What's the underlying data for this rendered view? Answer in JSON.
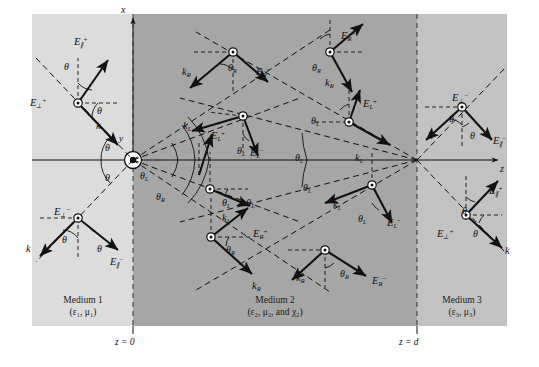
{
  "figure": {
    "type": "physics-ray-diagram",
    "axes": {
      "x_label": "x",
      "z_label": "z",
      "y_label": "y"
    },
    "boundaries": [
      {
        "name": "z=0",
        "label": "z = 0",
        "x": 133
      },
      {
        "name": "z=d",
        "label": "z = d",
        "x": 417
      }
    ],
    "media": [
      {
        "id": "medium1",
        "name": "Medium 1",
        "params": "(ε₁, μ₁)",
        "shade": "#dcdcdc"
      },
      {
        "id": "medium2",
        "name": "Medium 2",
        "params": "(ε₂, μ₂, and χ₂)",
        "shade": "#a8a8a8"
      },
      {
        "id": "medium3",
        "name": "Medium 3",
        "params": "(ε₃, μ₃)",
        "shade": "#c4c4c4"
      }
    ],
    "angle_labels": [
      {
        "name": "theta-m1-inc-upper",
        "text": "θ",
        "x": 64,
        "y": 61
      },
      {
        "name": "theta-m1-inc-lower",
        "text": "θ",
        "x": 97,
        "y": 105
      },
      {
        "name": "theta-origin-upper",
        "text": "θ",
        "x": 105,
        "y": 142
      },
      {
        "name": "theta-origin-lower",
        "text": "θ",
        "x": 105,
        "y": 172
      },
      {
        "name": "theta-m1-ref-upper",
        "text": "θ",
        "x": 62,
        "y": 234
      },
      {
        "name": "theta-m1-ref-lower",
        "text": "θ",
        "x": 97,
        "y": 243
      },
      {
        "name": "thetaL-origin",
        "text": "θ",
        "sub": "L",
        "x": 140,
        "y": 170
      },
      {
        "name": "thetaR-origin",
        "text": "θ",
        "sub": "R",
        "x": 156,
        "y": 191
      },
      {
        "name": "thetaR-m2-topleft",
        "text": "θ",
        "sub": "R",
        "x": 228,
        "y": 62
      },
      {
        "name": "thetaL-m2-upper",
        "text": "θ",
        "sub": "L",
        "x": 237,
        "y": 145
      },
      {
        "name": "thetaL-m2-lower-left",
        "text": "θ",
        "sub": "L",
        "x": 222,
        "y": 197
      },
      {
        "name": "thetaR-m2-lowerleft",
        "text": "θ",
        "sub": "R",
        "x": 226,
        "y": 244
      },
      {
        "name": "thetaR-m2-topright",
        "text": "θ",
        "sub": "R",
        "x": 312,
        "y": 62
      },
      {
        "name": "thetaL-m2-topright",
        "text": "θ",
        "sub": "L",
        "x": 311,
        "y": 115
      },
      {
        "name": "thetaL-m2-bigarc",
        "text": "θ",
        "sub": "L",
        "x": 295,
        "y": 152
      },
      {
        "name": "thetaL-m2-mid",
        "text": "θ",
        "sub": "L",
        "x": 303,
        "y": 182
      },
      {
        "name": "thetaL-m2-node",
        "text": "θ",
        "sub": "L",
        "x": 358,
        "y": 213
      },
      {
        "name": "thetaR-m2-bottom",
        "text": "θ",
        "sub": "R",
        "x": 340,
        "y": 268
      },
      {
        "name": "theta-m3-upper-a",
        "text": "θ",
        "x": 449,
        "y": 113
      },
      {
        "name": "theta-m3-upper-b",
        "text": "θ",
        "x": 470,
        "y": 130
      },
      {
        "name": "theta-m3-lower-a",
        "text": "θ",
        "x": 462,
        "y": 205
      },
      {
        "name": "theta-m3-lower-b",
        "text": "θ",
        "x": 473,
        "y": 228
      }
    ],
    "field_labels": [
      {
        "name": "E-par-plus-m1",
        "base": "E",
        "sub": "∥",
        "sup": "+",
        "x": 74,
        "y": 36
      },
      {
        "name": "E-perp-plus-m1",
        "base": "E",
        "sub": "⊥",
        "sup": "+",
        "x": 30,
        "y": 97
      },
      {
        "name": "k-inc-m1",
        "base": "k",
        "sub": "",
        "sup": "",
        "x": 96,
        "y": 120
      },
      {
        "name": "E-perp-minus-m1",
        "base": "E",
        "sub": "⊥",
        "sup": "−",
        "x": 54,
        "y": 206
      },
      {
        "name": "k-ref-m1",
        "base": "k",
        "sub": "",
        "sup": "",
        "x": 26,
        "y": 243
      },
      {
        "name": "E-par-minus-m1",
        "base": "E",
        "sub": "∥",
        "sup": "−",
        "x": 110,
        "y": 256
      },
      {
        "name": "kR-m2-topleft",
        "base": "k",
        "sub": "R",
        "sup": "",
        "x": 182,
        "y": 66
      },
      {
        "name": "ER-minus-m2-topleft",
        "base": "E",
        "sub": "R",
        "sup": "−",
        "x": 256,
        "y": 66
      },
      {
        "name": "kL-m2-upper",
        "base": "k",
        "sub": "L",
        "sup": "",
        "x": 183,
        "y": 120
      },
      {
        "name": "EL-plus-m2-upper",
        "base": "E",
        "sub": "L",
        "sup": "+",
        "x": 211,
        "y": 130
      },
      {
        "name": "EL-minus-m2-upper",
        "base": "E",
        "sub": "L",
        "sup": "−",
        "x": 250,
        "y": 147
      },
      {
        "name": "thetaL-lbl-m2-mid",
        "base": "θ",
        "sub": "L",
        "sup": "",
        "x": 246,
        "y": 197
      },
      {
        "name": "kL-m2-mid",
        "base": "k",
        "sub": "L",
        "sup": "",
        "x": 222,
        "y": 212
      },
      {
        "name": "ER-plus-m2-low",
        "base": "E",
        "sub": "R",
        "sup": "+",
        "x": 253,
        "y": 228
      },
      {
        "name": "kR-m2-lowleft",
        "base": "k",
        "sub": "R",
        "sup": "",
        "x": 252,
        "y": 280
      },
      {
        "name": "ER-plus-m2-topright",
        "base": "E",
        "sub": "R",
        "sup": "+",
        "x": 341,
        "y": 30
      },
      {
        "name": "kR-m2-topright",
        "base": "k",
        "sub": "R",
        "sup": "",
        "x": 325,
        "y": 77
      },
      {
        "name": "EL-plus-m2-topright",
        "base": "E",
        "sub": "L",
        "sup": "+",
        "x": 363,
        "y": 98
      },
      {
        "name": "kL-m2-topright",
        "base": "k",
        "sub": "L",
        "sup": "",
        "x": 355,
        "y": 152
      },
      {
        "name": "kL-m2-center",
        "base": "k",
        "sub": "L",
        "sup": "",
        "x": 333,
        "y": 199
      },
      {
        "name": "EL-minus-m2-center",
        "base": "E",
        "sub": "L",
        "sup": "−",
        "x": 387,
        "y": 217
      },
      {
        "name": "kR-m2-bottom",
        "base": "k",
        "sub": "R",
        "sup": "",
        "x": 296,
        "y": 272
      },
      {
        "name": "ER-minus-m2-bottom",
        "base": "E",
        "sub": "R",
        "sup": "−",
        "x": 372,
        "y": 275
      },
      {
        "name": "E-perp-minus-m3",
        "base": "E",
        "sub": "⊥",
        "sup": "−",
        "x": 452,
        "y": 92
      },
      {
        "name": "k-m3-upper",
        "base": "k",
        "sub": "",
        "sup": "",
        "x": 428,
        "y": 130
      },
      {
        "name": "E-par-minus-m3",
        "base": "E",
        "sub": "∥",
        "sup": "−",
        "x": 493,
        "y": 135
      },
      {
        "name": "E-par-plus-m3",
        "base": "E",
        "sub": "∥",
        "sup": "+",
        "x": 489,
        "y": 185
      },
      {
        "name": "E-perp-plus-m3",
        "base": "E",
        "sub": "⊥",
        "sup": "+",
        "x": 437,
        "y": 228
      },
      {
        "name": "k-m3-lower",
        "base": "k",
        "sub": "",
        "sup": "",
        "x": 505,
        "y": 245
      }
    ]
  }
}
